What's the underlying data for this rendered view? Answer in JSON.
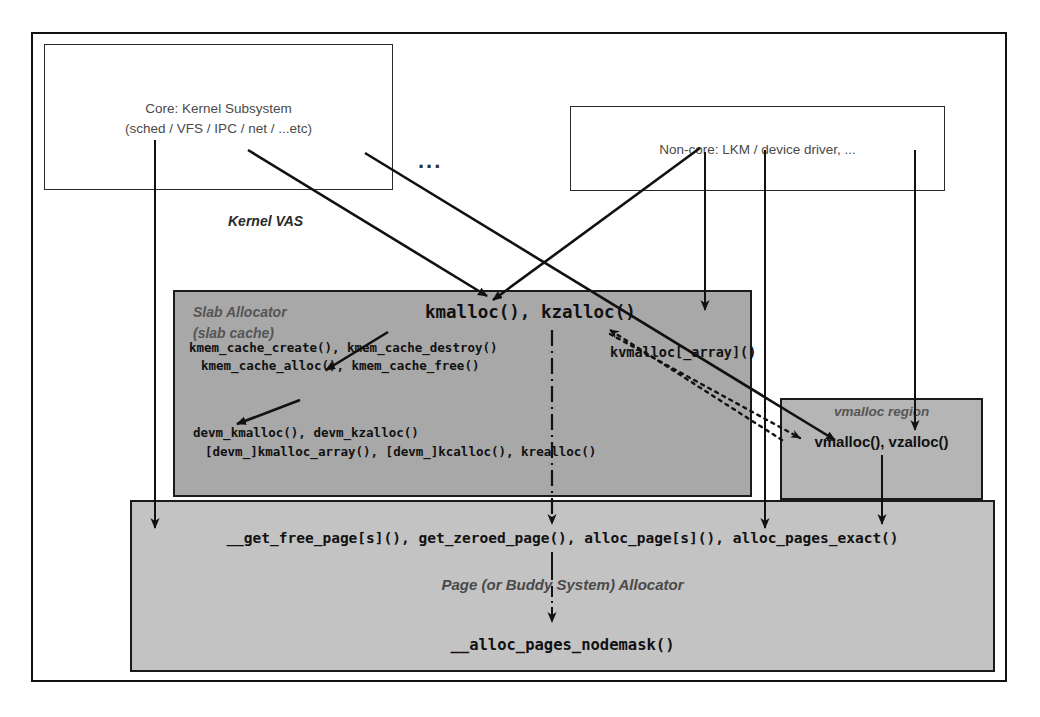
{
  "diagram": {
    "title_note": "Linux kernel memory allocation layers",
    "kernel_vas_label": "Kernel VAS",
    "ellipsis": "...",
    "consumers": [
      {
        "id": "core",
        "line1": "Core: Kernel Subsystem",
        "line2": "(sched / VFS / IPC / net / ...etc)"
      },
      {
        "id": "noncore",
        "line1": "Non-core: LKM / device driver, ..."
      }
    ],
    "slab": {
      "header_line1": "Slab Allocator",
      "header_line2": "(slab cache)",
      "main_api": "kmalloc(), kzalloc()",
      "api_line1": "kmem_cache_create(), kmem_cache_destroy()",
      "api_line2": "kmem_cache_alloc(), kmem_cache_free()",
      "api_line3": "devm_kmalloc(), devm_kzalloc()",
      "api_line4": "[devm_]kmalloc_array(), [devm_]kcalloc(), krealloc()",
      "kvmalloc": "kvmalloc[_array]()"
    },
    "vmalloc": {
      "header": "vmalloc region",
      "api": "vmalloc(), vzalloc()"
    },
    "page_allocator": {
      "api_line": "__get_free_page[s](), get_zeroed_page(), alloc_page[s](), alloc_pages_exact()",
      "header": "Page (or Buddy System) Allocator",
      "bottom_api": "__alloc_pages_nodemask()"
    },
    "colors": {
      "slab_fill": "#a8a8a8",
      "vmalloc_fill": "#b5b5b5",
      "page_fill": "#c3c3c3",
      "stroke": "#1a1a1a",
      "label_gray": "#4a4a4a"
    }
  }
}
